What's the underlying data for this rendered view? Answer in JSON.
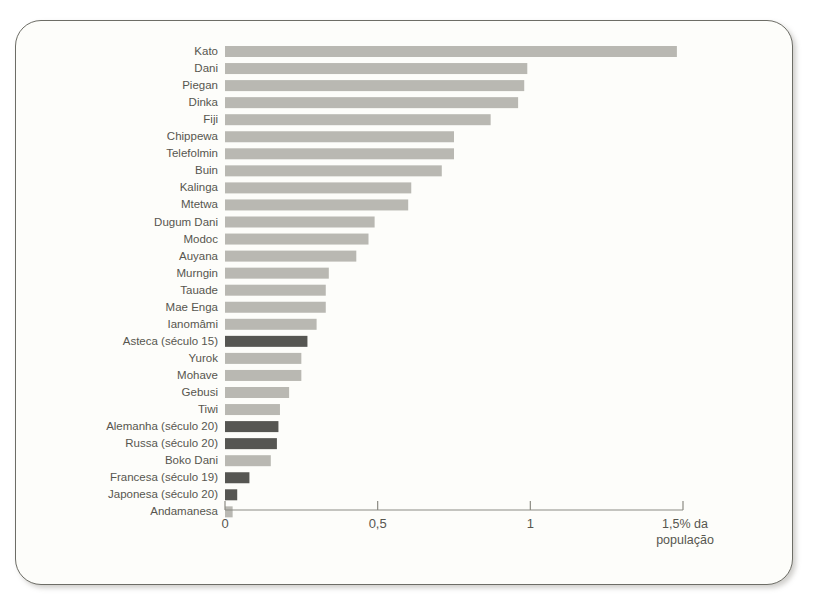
{
  "chart_data": {
    "type": "bar",
    "orientation": "horizontal",
    "title": "",
    "subtitle": "",
    "xlabel": "1,5% da população",
    "ylabel": "",
    "xlim": [
      0,
      1.5
    ],
    "grid": false,
    "legend": null,
    "axis_ticks": [
      "0",
      "0,5",
      "1",
      "1,5"
    ],
    "axis_tick_values": [
      0,
      0.5,
      1,
      1.5
    ],
    "axis_caption_line1": "1,5% da",
    "axis_caption_line2": "população",
    "colors": {
      "bar_light": "#b9b8b2",
      "bar_dark": "#565652",
      "axis": "#8c8b83",
      "text": "#57564f",
      "background": "#fdfdfa",
      "frame_border": "#6d6d66"
    },
    "categories": [
      "Kato",
      "Dani",
      "Piegan",
      "Dinka",
      "Fiji",
      "Chippewa",
      "Telefolmin",
      "Buin",
      "Kalinga",
      "Mtetwa",
      "Dugum Dani",
      "Modoc",
      "Auyana",
      "Murngin",
      "Tauade",
      "Mae Enga",
      "Ianomâmi",
      "Asteca (século 15)",
      "Yurok",
      "Mohave",
      "Gebusi",
      "Tiwi",
      "Alemanha (século 20)",
      "Russa (século 20)",
      "Boko Dani",
      "Francesa (século 19)",
      "Japonesa (século 20)",
      "Andamanesa"
    ],
    "values": [
      1.48,
      0.99,
      0.98,
      0.96,
      0.87,
      0.75,
      0.75,
      0.71,
      0.61,
      0.6,
      0.49,
      0.47,
      0.43,
      0.34,
      0.33,
      0.33,
      0.3,
      0.27,
      0.25,
      0.25,
      0.21,
      0.18,
      0.175,
      0.17,
      0.15,
      0.08,
      0.04,
      0.025
    ],
    "bar_shades": [
      "light",
      "light",
      "light",
      "light",
      "light",
      "light",
      "light",
      "light",
      "light",
      "light",
      "light",
      "light",
      "light",
      "light",
      "light",
      "light",
      "light",
      "dark",
      "light",
      "light",
      "light",
      "light",
      "dark",
      "dark",
      "light",
      "dark",
      "dark",
      "light"
    ]
  }
}
